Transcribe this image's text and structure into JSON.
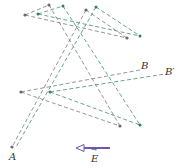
{
  "diagram": {
    "labels": {
      "A": "A",
      "B": "B",
      "B_prime": "B′",
      "E": "E",
      "E_arrow": "→"
    },
    "colors": {
      "original": "#7a7a7a",
      "displaced": "#3f8f6f",
      "field_arrow": "#6a58b0"
    },
    "original_points": [
      [
        25,
        15
      ],
      [
        49,
        5
      ],
      [
        86,
        10
      ],
      [
        127,
        38
      ],
      [
        21,
        92
      ],
      [
        120,
        126
      ],
      [
        12,
        147
      ]
    ],
    "displaced_points": [
      [
        38,
        14
      ],
      [
        63,
        6
      ],
      [
        96,
        7
      ],
      [
        140,
        36
      ],
      [
        50,
        92
      ],
      [
        140,
        125
      ]
    ],
    "field": {
      "direction": "left"
    }
  }
}
